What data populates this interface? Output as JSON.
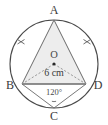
{
  "figure": {
    "background_color": "#ffffff",
    "stroke_color": "#4a4a4a",
    "triangle_fill": "#ededed",
    "dash_color": "#8a8a8a",
    "text_color": "#3a3a3a"
  },
  "labels": {
    "vertex_a": "A",
    "vertex_b": "B",
    "vertex_c": "C",
    "vertex_d": "D",
    "center_o": "O",
    "radius_measure": "6 cm",
    "angle_c": "120°"
  },
  "geometry": {
    "circle": {
      "cx": 54,
      "cy": 64,
      "r": 44
    },
    "center_point": {
      "x": 54,
      "y": 64
    },
    "points": {
      "A": {
        "x": 54,
        "y": 20
      },
      "B": {
        "x": 22,
        "y": 84
      },
      "C": {
        "x": 54,
        "y": 108
      },
      "D": {
        "x": 86,
        "y": 84
      }
    },
    "triangle_vertices": "54,20 22,84 86,84",
    "arc_tick_marks": 2,
    "angle_arc_radius": 7
  }
}
